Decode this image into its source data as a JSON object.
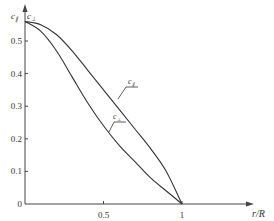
{
  "chart_data": {
    "type": "line",
    "title": "",
    "xlabel": "r/R",
    "ylabel": "c",
    "xlim": [
      0,
      1.1
    ],
    "ylim": [
      0,
      0.6
    ],
    "x_ticks": [
      "0.5",
      "1"
    ],
    "y_ticks": [
      "0",
      "0.1",
      "0.2",
      "0.3",
      "0.4",
      "0.5"
    ],
    "origin_label": "0",
    "grid": false,
    "legend": "inline annotations",
    "series": [
      {
        "name": "c_∥",
        "label_main": "c",
        "label_sub": "∥",
        "x": [
          0,
          0.1,
          0.2,
          0.3,
          0.4,
          0.5,
          0.6,
          0.7,
          0.8,
          0.9,
          1.0
        ],
        "y": [
          0.56,
          0.55,
          0.52,
          0.47,
          0.41,
          0.35,
          0.29,
          0.23,
          0.17,
          0.1,
          0.0
        ]
      },
      {
        "name": "c_⊥",
        "label_main": "c",
        "label_sub": "⊥",
        "x": [
          0,
          0.1,
          0.2,
          0.3,
          0.4,
          0.5,
          0.6,
          0.7,
          0.8,
          0.9,
          1.0
        ],
        "y": [
          0.56,
          0.53,
          0.47,
          0.39,
          0.31,
          0.24,
          0.18,
          0.13,
          0.08,
          0.04,
          0.0
        ]
      }
    ]
  }
}
